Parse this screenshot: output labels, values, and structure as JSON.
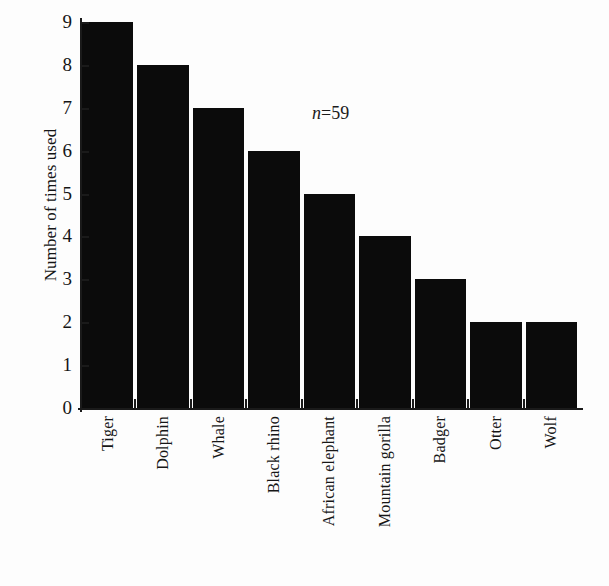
{
  "figure": {
    "background_color": "#ffffff",
    "ink_color": "#0b0b0b",
    "annotation": {
      "italic_symbol": "n",
      "rest": "=59",
      "full_text": "n=59"
    }
  },
  "chart_data": {
    "type": "bar",
    "title": "",
    "subtitle": "",
    "xlabel": "",
    "ylabel": "Number of times used",
    "categories": [
      "Tiger",
      "Dolphin",
      "Whale",
      "Black rhino",
      "African elephant",
      "Mountain gorilla",
      "Badger",
      "Otter",
      "Wolf"
    ],
    "values": [
      9,
      8,
      7,
      6,
      5,
      4,
      3,
      2,
      2
    ],
    "ylim": [
      0,
      9
    ],
    "ytick_labels": [
      "0",
      "1",
      "2",
      "3",
      "4",
      "5",
      "6",
      "7",
      "8",
      "9"
    ],
    "ytick_values": [
      0,
      1,
      2,
      3,
      4,
      5,
      6,
      7,
      8,
      9
    ],
    "grid": false,
    "legend": null,
    "legend_position": "none",
    "annotations": [
      {
        "text": "n=59",
        "x_category": "African elephant",
        "y_value": 6.5
      }
    ],
    "bar_color": "#0b0b0b",
    "orientation": "vertical",
    "xtick_label_rotation": -90
  }
}
